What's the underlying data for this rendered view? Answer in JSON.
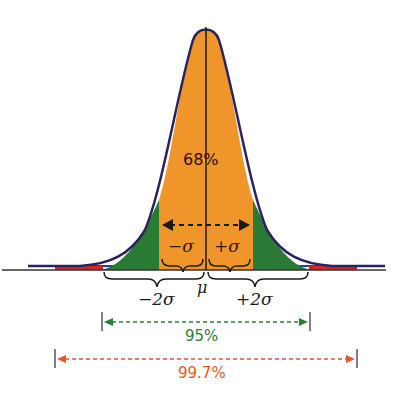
{
  "diagram": {
    "type": "normal-distribution",
    "center_label": "68%",
    "mean_label": "μ",
    "sigma_labels": {
      "minus_one": "−σ",
      "plus_one": "+σ",
      "minus_two": "−2σ",
      "plus_two": "+2σ"
    },
    "ranges": [
      {
        "label": "68%",
        "span": "±1σ",
        "color": "#1a1a1a"
      },
      {
        "label": "95%",
        "span": "±2σ",
        "color": "#2e7d3a"
      },
      {
        "label": "99.7%",
        "span": "±3σ",
        "color": "#e8562a"
      }
    ],
    "colors": {
      "one_sigma_fill": "#f0952a",
      "two_sigma_fill": "#2a7a35",
      "three_sigma_fill": "#d22a1f",
      "curve_outline": "#2b2360",
      "axis_blue": "#2c3e9c"
    }
  }
}
